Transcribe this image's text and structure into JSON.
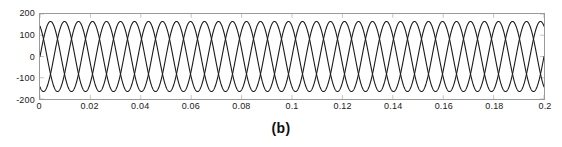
{
  "figure": {
    "caption": "(b)",
    "background_color": "#ffffff",
    "axis_color": "#9a9a9a",
    "grid": "minimal-top-ticks"
  },
  "chart_data": {
    "type": "line",
    "title": "",
    "xlabel": "",
    "ylabel": "",
    "xlim": [
      0,
      0.2
    ],
    "ylim": [
      -200,
      200
    ],
    "xticks": [
      0,
      0.02,
      0.04,
      0.06,
      0.08,
      0.1,
      0.12,
      0.14,
      0.16,
      0.18,
      0.2
    ],
    "xtick_labels": [
      "0",
      "0.02",
      "0.04",
      "0.06",
      "0.08",
      "0.1",
      "0.12",
      "0.14",
      "0.16",
      "0.18",
      "0.2"
    ],
    "yticks": [
      200,
      100,
      0,
      -100,
      -200
    ],
    "ytick_labels": [
      "200",
      "100",
      "0",
      "-100",
      "-200"
    ],
    "grid": false,
    "legend": null,
    "waveform": {
      "shape": "sinusoid",
      "amplitude": 165,
      "frequency_hz": 60,
      "cycles_shown": 12,
      "samples": 3000
    },
    "series": [
      {
        "name": "phase-a",
        "color": "#1a1a1a",
        "amplitude": 165,
        "frequency_hz": 60,
        "phase_deg": 0,
        "line_width": 1.1
      },
      {
        "name": "phase-b",
        "color": "#1a1a1a",
        "amplitude": 165,
        "frequency_hz": 60,
        "phase_deg": -120,
        "line_width": 1.1
      },
      {
        "name": "phase-c",
        "color": "#1a1a1a",
        "amplitude": 165,
        "frequency_hz": 60,
        "phase_deg": 120,
        "line_width": 1.1
      }
    ]
  }
}
